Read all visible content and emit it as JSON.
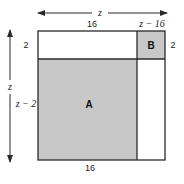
{
  "diagram": {
    "colors": {
      "stroke": "#2a2a2a",
      "shaded_fill": "#c8c8c8",
      "background": "#ffffff"
    },
    "top_dimension": {
      "label": "z"
    },
    "left_dimension": {
      "label": "z"
    },
    "top_segment_labels": {
      "left": "16",
      "right": "z − 16"
    },
    "left_segment_labels": {
      "top": "2",
      "bottom": "z − 2"
    },
    "right_label": "2",
    "bottom_label": "16",
    "regions": [
      {
        "name": "A",
        "label": "A",
        "shaded": true,
        "width": "16",
        "height": "z − 2"
      },
      {
        "name": "B",
        "label": "B",
        "shaded": true,
        "width": "z − 16",
        "height": "2"
      }
    ]
  }
}
